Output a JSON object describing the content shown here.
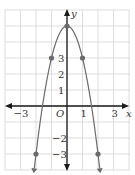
{
  "chart_data": {
    "type": "line",
    "title": "",
    "equation": "y = 5 - 2x^2",
    "xlabel": "x",
    "ylabel": "y",
    "origin_label": "O",
    "xlim": [
      -4,
      4
    ],
    "ylim": [
      -4,
      6
    ],
    "grid": true,
    "x_tick_labels": [
      {
        "value": -3,
        "text": "−3"
      },
      {
        "value": 1,
        "text": "1"
      },
      {
        "value": 3,
        "text": "3"
      }
    ],
    "y_tick_labels": [
      {
        "value": 3,
        "text": "3"
      },
      {
        "value": 2,
        "text": "2"
      },
      {
        "value": 1,
        "text": "1"
      },
      {
        "value": -2,
        "text": "−2"
      },
      {
        "value": -3,
        "text": "−3"
      }
    ],
    "series": [
      {
        "name": "parabola",
        "points": [
          {
            "x": -2,
            "y": -3
          },
          {
            "x": -1,
            "y": 3
          },
          {
            "x": 0,
            "y": 5
          },
          {
            "x": 1,
            "y": 3
          },
          {
            "x": 2,
            "y": -3
          }
        ],
        "color": "#6b6b6b"
      }
    ],
    "colors": {
      "grid": "#cfcfcf",
      "axis": "#1a1a1a",
      "curve": "#6b6b6b"
    }
  }
}
